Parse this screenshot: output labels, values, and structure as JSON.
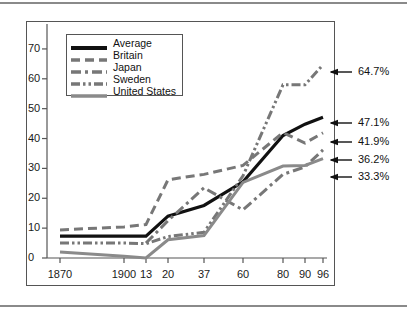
{
  "chart_data": {
    "type": "line",
    "title": "",
    "subtitle": "",
    "xlabel": "",
    "ylabel": "",
    "xlim": [
      0,
      8
    ],
    "ylim": [
      0,
      75
    ],
    "grid": false,
    "legend_position": "top-left",
    "categories": [
      "1870",
      "1900",
      "13",
      "20",
      "37",
      "60",
      "80",
      "90",
      "96"
    ],
    "xtick_labels": [
      "1870",
      "1900",
      "13",
      "20",
      "37",
      "60",
      "80",
      "90",
      "96"
    ],
    "ytick_labels": [
      "0",
      "10",
      "20",
      "30",
      "40",
      "50",
      "60",
      "70"
    ],
    "ytick_values": [
      0,
      10,
      20,
      30,
      40,
      50,
      60,
      70
    ],
    "series": [
      {
        "name": "Average",
        "color": "#111111",
        "style": "solid",
        "width": 3.2,
        "values": [
          7.3,
          7.3,
          7.3,
          14.0,
          17.6,
          25.5,
          41.0,
          44.8,
          47.1
        ],
        "end_label": "47.1%"
      },
      {
        "name": "Britain",
        "color": "#777777",
        "style": "dashed",
        "width": 3.0,
        "values": [
          9.4,
          10.4,
          11.2,
          26.2,
          28.0,
          31.0,
          42.0,
          38.5,
          41.9
        ],
        "end_label": "41.9%"
      },
      {
        "name": "Japan",
        "color": "#777777",
        "style": "dashdot",
        "width": 3.0,
        "values": [
          null,
          null,
          5.0,
          12.5,
          23.5,
          16.1,
          28.0,
          30.5,
          36.2
        ],
        "end_label": "36.2%"
      },
      {
        "name": "Sweden",
        "color": "#777777",
        "style": "dashdotdot",
        "width": 3.0,
        "values": [
          5.0,
          5.0,
          4.8,
          7.2,
          8.6,
          27.5,
          58.0,
          58.0,
          64.7
        ],
        "end_label": "64.7%"
      },
      {
        "name": "United States",
        "color": "#8a8a8a",
        "style": "solid",
        "width": 3.0,
        "values": [
          2.0,
          0.6,
          0.0,
          6.1,
          7.5,
          25.3,
          30.8,
          31.0,
          33.3
        ],
        "end_label": "33.3%"
      }
    ],
    "annotations": [
      {
        "label": "64.7%",
        "series": "Sweden"
      },
      {
        "label": "47.1%",
        "series": "Average"
      },
      {
        "label": "41.9%",
        "series": "Britain"
      },
      {
        "label": "36.2%",
        "series": "Japan"
      },
      {
        "label": "33.3%",
        "series": "United States"
      }
    ]
  },
  "legend": {
    "items": [
      {
        "label": "Average"
      },
      {
        "label": "Britain"
      },
      {
        "label": "Japan"
      },
      {
        "label": "Sweden"
      },
      {
        "label": "United States"
      }
    ]
  }
}
